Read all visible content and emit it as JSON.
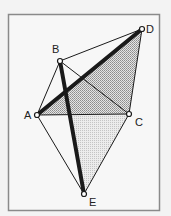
{
  "diagram": {
    "frame": {
      "x": 8,
      "y": 14,
      "width": 152,
      "height": 197,
      "stroke": "#8a8a8a",
      "fill": "#f6f6f6"
    },
    "points": {
      "A": {
        "x": 37,
        "y": 115,
        "label": "A",
        "lx": 24,
        "ly": 119
      },
      "B": {
        "x": 60,
        "y": 61,
        "label": "B",
        "lx": 52,
        "ly": 53
      },
      "C": {
        "x": 129,
        "y": 114,
        "label": "C",
        "lx": 135,
        "ly": 126
      },
      "D": {
        "x": 142,
        "y": 29,
        "label": "D",
        "lx": 146,
        "ly": 33
      },
      "E": {
        "x": 84,
        "y": 194,
        "label": "E",
        "lx": 89,
        "ly": 206
      }
    },
    "shaded_regions": [
      {
        "name": "triangle-ADC",
        "vertices": [
          "A",
          "D",
          "C"
        ],
        "pattern": "dense-dots",
        "color": "#a8a8a8"
      },
      {
        "name": "region-PCE",
        "polygon": [
          [
            70,
            115
          ],
          [
            129,
            114
          ],
          [
            84,
            194
          ]
        ],
        "pattern": "light-dots",
        "color": "#d2d2d2"
      }
    ],
    "segments": [
      {
        "from": "A",
        "to": "B",
        "weight": "thin"
      },
      {
        "from": "B",
        "to": "D",
        "weight": "thin"
      },
      {
        "from": "B",
        "to": "C",
        "weight": "thin"
      },
      {
        "from": "A",
        "to": "C",
        "weight": "thin"
      },
      {
        "from": "D",
        "to": "C",
        "weight": "thin"
      },
      {
        "from": "A",
        "to": "E",
        "weight": "thin"
      },
      {
        "from": "C",
        "to": "E",
        "weight": "thin"
      },
      {
        "from": "A",
        "to": "D",
        "weight": "thick"
      },
      {
        "from": "B",
        "to": "E",
        "weight": "thick"
      }
    ],
    "colors": {
      "line": "#1a1a1a",
      "point_fill": "#ffffff"
    }
  }
}
